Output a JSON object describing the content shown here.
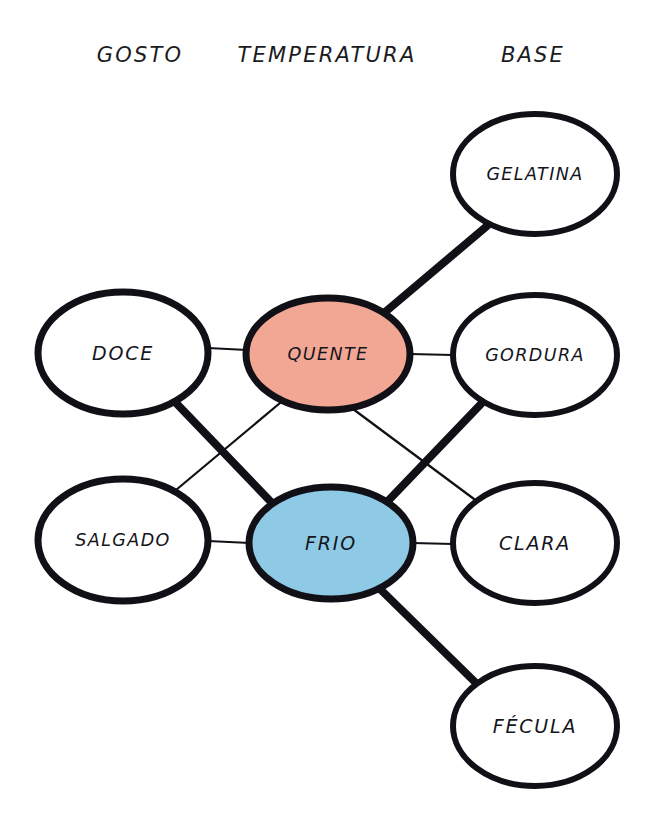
{
  "diagram": {
    "background_color": "#ffffff",
    "ink_color": "#111016",
    "columns": [
      {
        "id": "gosto",
        "label": "GOSTO",
        "x": 140,
        "y": 55
      },
      {
        "id": "temperatura",
        "label": "TEMPERATURA",
        "x": 327,
        "y": 55
      },
      {
        "id": "base",
        "label": "BASE",
        "x": 533,
        "y": 55
      }
    ],
    "nodes": [
      {
        "id": "doce",
        "label": "DOCE",
        "column": "gosto",
        "fill": "#ffffff",
        "stroke_width": 7,
        "cx": 123,
        "cy": 353,
        "rx": 85,
        "ry": 61
      },
      {
        "id": "salgado",
        "label": "SALGADO",
        "column": "gosto",
        "fill": "#ffffff",
        "stroke_width": 7,
        "cx": 123,
        "cy": 540,
        "rx": 85,
        "ry": 61
      },
      {
        "id": "quente",
        "label": "QUENTE",
        "column": "temperatura",
        "fill": "#f2a795",
        "stroke_width": 7,
        "cx": 328,
        "cy": 354,
        "rx": 82,
        "ry": 56
      },
      {
        "id": "frio",
        "label": "FRIO",
        "column": "temperatura",
        "fill": "#8ecae6",
        "stroke_width": 7,
        "cx": 331,
        "cy": 543,
        "rx": 82,
        "ry": 56
      },
      {
        "id": "gelatina",
        "label": "GELATINA",
        "column": "base",
        "fill": "#ffffff",
        "stroke_width": 6,
        "cx": 535,
        "cy": 174,
        "rx": 82,
        "ry": 60
      },
      {
        "id": "gordura",
        "label": "GORDURA",
        "column": "base",
        "fill": "#ffffff",
        "stroke_width": 6,
        "cx": 535,
        "cy": 355,
        "rx": 82,
        "ry": 60
      },
      {
        "id": "clara",
        "label": "CLARA",
        "column": "base",
        "fill": "#ffffff",
        "stroke_width": 6,
        "cx": 535,
        "cy": 543,
        "rx": 82,
        "ry": 60
      },
      {
        "id": "fecula",
        "label": "FÉCULA",
        "column": "base",
        "fill": "#ffffff",
        "stroke_width": 6,
        "cx": 535,
        "cy": 726,
        "rx": 82,
        "ry": 60
      }
    ],
    "edges": [
      {
        "id": "doce-quente",
        "from": "doce",
        "to": "quente",
        "weight": "thin",
        "x1": 208,
        "y1": 348,
        "x2": 247,
        "y2": 350
      },
      {
        "id": "doce-frio",
        "from": "doce",
        "to": "frio",
        "weight": "thick",
        "x1": 177,
        "y1": 404,
        "x2": 272,
        "y2": 503
      },
      {
        "id": "salgado-quente",
        "from": "salgado",
        "to": "quente",
        "weight": "thin",
        "x1": 176,
        "y1": 490,
        "x2": 286,
        "y2": 398
      },
      {
        "id": "salgado-frio",
        "from": "salgado",
        "to": "frio",
        "weight": "thin",
        "x1": 208,
        "y1": 541,
        "x2": 250,
        "y2": 543
      },
      {
        "id": "quente-gelatina",
        "from": "quente",
        "to": "gelatina",
        "weight": "thick",
        "x1": 384,
        "y1": 313,
        "x2": 487,
        "y2": 226
      },
      {
        "id": "quente-gordura",
        "from": "quente",
        "to": "gordura",
        "weight": "thin",
        "x1": 410,
        "y1": 354,
        "x2": 453,
        "y2": 355
      },
      {
        "id": "quente-clara",
        "from": "quente",
        "to": "clara",
        "weight": "thin",
        "x1": 353,
        "y1": 409,
        "x2": 474,
        "y2": 499
      },
      {
        "id": "frio-gordura",
        "from": "frio",
        "to": "gordura",
        "weight": "thick",
        "x1": 386,
        "y1": 503,
        "x2": 481,
        "y2": 404
      },
      {
        "id": "frio-clara",
        "from": "frio",
        "to": "clara",
        "weight": "thin",
        "x1": 413,
        "y1": 543,
        "x2": 453,
        "y2": 544
      },
      {
        "id": "frio-fecula",
        "from": "frio",
        "to": "fecula",
        "weight": "thick",
        "x1": 379,
        "y1": 588,
        "x2": 478,
        "y2": 685
      }
    ],
    "edge_weights": {
      "thin": 2.2,
      "thick": 8
    }
  }
}
